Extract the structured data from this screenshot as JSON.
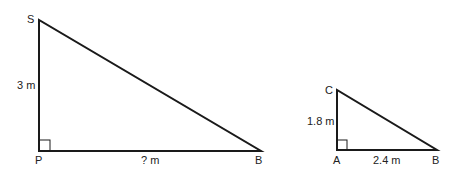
{
  "triangle1": {
    "vertices": {
      "top": "S",
      "corner": "P",
      "right": "B"
    },
    "side_vertical": "3 m",
    "side_horizontal": "? m"
  },
  "triangle2": {
    "vertices": {
      "top": "C",
      "corner": "A",
      "right": "B"
    },
    "side_vertical": "1.8 m",
    "side_horizontal": "2.4 m"
  },
  "colors": {
    "stroke": "#1a1a1a",
    "text": "#222222"
  }
}
